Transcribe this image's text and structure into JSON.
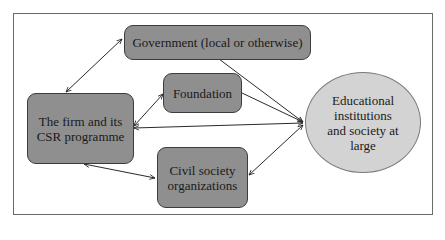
{
  "diagram": {
    "type": "flow",
    "nodes": {
      "firm": {
        "label_line1": "The firm and its",
        "label_line2": "CSR programme"
      },
      "government": {
        "label": "Government (local or otherwise)"
      },
      "foundation": {
        "label": "Foundation"
      },
      "civil_society": {
        "label_line1": "Civil society",
        "label_line2": "organizations"
      },
      "education": {
        "label_line1": "Educational",
        "label_line2": "institutions",
        "label_line3": "and society at",
        "label_line4": "large"
      }
    },
    "edges": [
      {
        "from": "firm",
        "to": "government",
        "direction": "both"
      },
      {
        "from": "firm",
        "to": "foundation",
        "direction": "both"
      },
      {
        "from": "firm",
        "to": "education",
        "direction": "both"
      },
      {
        "from": "firm",
        "to": "civil_society",
        "direction": "both"
      },
      {
        "from": "government",
        "to": "education",
        "direction": "forward"
      },
      {
        "from": "foundation",
        "to": "education",
        "direction": "forward"
      },
      {
        "from": "civil_society",
        "to": "education",
        "direction": "both"
      }
    ],
    "colors": {
      "box_fill": "#8f8f8f",
      "ellipse_fill": "#d3d3d3",
      "line": "#2a2a2a"
    }
  }
}
